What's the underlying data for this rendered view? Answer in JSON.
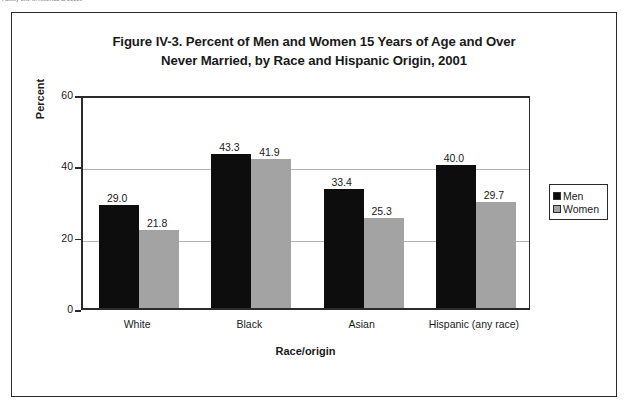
{
  "page": {
    "clipped_caption": "Family Life in America at 2000s"
  },
  "figure": {
    "title_line1": "Figure IV-3. Percent of Men and Women 15 Years of Age and Over",
    "title_line2": "Never Married, by Race and Hispanic Origin, 2001"
  },
  "legend": {
    "items": [
      {
        "label": "Men",
        "color": "#0d0d0d"
      },
      {
        "label": "Women",
        "color": "#a3a3a3"
      }
    ]
  },
  "chart_data": {
    "type": "bar",
    "title": "Figure IV-3. Percent of Men and Women 15 Years of Age and Over Never Married, by Race and Hispanic Origin, 2001",
    "xlabel": "Race/origin",
    "ylabel": "Percent",
    "ylim": [
      0,
      60
    ],
    "yticks": [
      0,
      20,
      40,
      60
    ],
    "ytick_labels": [
      "0",
      "20",
      "40",
      "60"
    ],
    "grid": true,
    "legend_position": "right-outside",
    "categories": [
      "White",
      "Black",
      "Asian",
      "Hispanic (any race)"
    ],
    "series": [
      {
        "name": "Men",
        "color": "#0d0d0d",
        "values": [
          29.0,
          43.3,
          33.4,
          40.0
        ],
        "labels": [
          "29.0",
          "43.3",
          "33.4",
          "40.0"
        ]
      },
      {
        "name": "Women",
        "color": "#a3a3a3",
        "values": [
          21.8,
          41.9,
          25.3,
          29.7
        ],
        "labels": [
          "21.8",
          "41.9",
          "25.3",
          "29.7"
        ]
      }
    ]
  }
}
